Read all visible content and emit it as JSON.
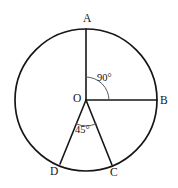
{
  "figure": {
    "background_color": "#ffffff",
    "stroke_color": "#161616",
    "arc_mark_color": "#5a5a5a",
    "circle": {
      "center_label": "O",
      "center_x": 86,
      "center_y": 100,
      "radius": 71
    },
    "points": [
      {
        "id": "A",
        "label": "A",
        "x": 86,
        "y": 29,
        "angle_deg": 90,
        "description": "top of circle"
      },
      {
        "id": "B",
        "label": "B",
        "x": 157,
        "y": 100,
        "angle_deg": 0,
        "description": "right of circle"
      },
      {
        "id": "C",
        "label": "C",
        "x": 112,
        "y": 165,
        "angle_deg": 293,
        "description": "lower right of circle"
      },
      {
        "id": "D",
        "label": "D",
        "x": 60,
        "y": 164,
        "angle_deg": 248,
        "description": "lower left of circle"
      }
    ],
    "radii": [
      {
        "from": "O",
        "to": "A"
      },
      {
        "from": "O",
        "to": "B"
      },
      {
        "from": "O",
        "to": "C"
      },
      {
        "from": "O",
        "to": "D"
      }
    ],
    "angles": [
      {
        "id": "aob",
        "label": "90°",
        "value": 90,
        "unit": "degrees",
        "between": [
          "A",
          "B"
        ],
        "vertex": "O",
        "arc_radius": 23
      },
      {
        "id": "doc",
        "label": "45°",
        "value": 45,
        "unit": "degrees",
        "between": [
          "D",
          "C"
        ],
        "vertex": "O",
        "arc_radius": 26
      }
    ]
  }
}
